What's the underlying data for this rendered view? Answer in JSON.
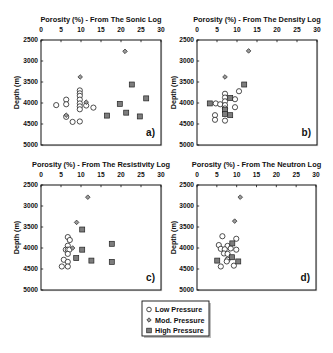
{
  "legend": {
    "items": [
      {
        "label": "Low Pressure",
        "marker": "circle"
      },
      {
        "label": "Mod. Pressure",
        "marker": "diamond"
      },
      {
        "label": "High Pressure",
        "marker": "square"
      }
    ]
  },
  "colors": {
    "axis": "#111111",
    "marker_edge": "#222222",
    "mod_fill": "#9a9a9a",
    "high_fill": "#7d7d7d",
    "low_fill": "#ffffff"
  },
  "chart_data": [
    {
      "type": "scatter",
      "panel_label": "a)",
      "title": "Porosity (%) - From The Sonic Log",
      "xlabel": "Porosity (%) - From The Sonic Log",
      "ylabel": "Depth (m)",
      "xlim": [
        0,
        30
      ],
      "ylim": [
        2500,
        5000
      ],
      "y_inverted": true,
      "x_axis_position": "top",
      "xticks": [
        0,
        5,
        10,
        15,
        20,
        25,
        30
      ],
      "yticks": [
        2500,
        3000,
        3500,
        4000,
        4500,
        5000
      ],
      "grid": false,
      "series": [
        {
          "name": "Low Pressure",
          "marker": "circle",
          "points": [
            [
              3.8,
              4050
            ],
            [
              6.3,
              3920
            ],
            [
              6.3,
              4030
            ],
            [
              6.3,
              4330
            ],
            [
              7.9,
              4450
            ],
            [
              9.7,
              4440
            ],
            [
              9.7,
              3700
            ],
            [
              9.7,
              3770
            ],
            [
              9.7,
              3830
            ],
            [
              9.7,
              3920
            ],
            [
              9.7,
              4010
            ],
            [
              9.7,
              4080
            ],
            [
              9.7,
              4150
            ],
            [
              11.3,
              4060
            ],
            [
              13.1,
              4110
            ]
          ]
        },
        {
          "name": "Mod. Pressure",
          "marker": "diamond",
          "points": [
            [
              21.0,
              2770
            ],
            [
              9.8,
              3380
            ],
            [
              11.3,
              3980
            ],
            [
              6.3,
              4290
            ]
          ]
        },
        {
          "name": "High Pressure",
          "marker": "square",
          "points": [
            [
              22.7,
              3560
            ],
            [
              26.3,
              3890
            ],
            [
              19.7,
              4020
            ],
            [
              16.5,
              4300
            ],
            [
              21.3,
              4230
            ],
            [
              24.7,
              4320
            ]
          ]
        }
      ]
    },
    {
      "type": "scatter",
      "panel_label": "b)",
      "title": "Porosity (%) - From The Density Log",
      "xlabel": "Porosity (%) - From The Density Log",
      "ylabel": "Depth (m)",
      "xlim": [
        0,
        30
      ],
      "ylim": [
        2500,
        5000
      ],
      "y_inverted": true,
      "x_axis_position": "top",
      "xticks": [
        0,
        5,
        10,
        15,
        20,
        25,
        30
      ],
      "yticks": [
        2500,
        3000,
        3500,
        4000,
        4500,
        5000
      ],
      "grid": false,
      "series": [
        {
          "name": "Low Pressure",
          "marker": "circle",
          "points": [
            [
              10.5,
              3720
            ],
            [
              7.0,
              3780
            ],
            [
              7.0,
              3870
            ],
            [
              9.5,
              3910
            ],
            [
              7.0,
              3960
            ],
            [
              4.7,
              4010
            ],
            [
              5.8,
              4030
            ],
            [
              7.0,
              4050
            ],
            [
              9.5,
              4100
            ],
            [
              7.0,
              4130
            ],
            [
              4.5,
              4290
            ],
            [
              4.5,
              4400
            ],
            [
              7.0,
              4420
            ]
          ]
        },
        {
          "name": "Mod. Pressure",
          "marker": "diamond",
          "points": [
            [
              12.9,
              2760
            ],
            [
              7.0,
              3380
            ]
          ]
        },
        {
          "name": "High Pressure",
          "marker": "square",
          "points": [
            [
              11.8,
              3560
            ],
            [
              8.3,
              3880
            ],
            [
              3.2,
              4010
            ],
            [
              7.0,
              4170
            ],
            [
              7.0,
              4260
            ],
            [
              8.3,
              4290
            ]
          ]
        }
      ]
    },
    {
      "type": "scatter",
      "panel_label": "c)",
      "title": "Porosity (%) - From The Resistivity Log",
      "xlabel": "Porosity (%) - From The Resistivity Log",
      "ylabel": "Depth (m)",
      "xlim": [
        0,
        30
      ],
      "ylim": [
        2500,
        5000
      ],
      "y_inverted": true,
      "x_axis_position": "top",
      "xticks": [
        0,
        5,
        10,
        15,
        20,
        25,
        30
      ],
      "yticks": [
        2500,
        3000,
        3500,
        4000,
        4500,
        5000
      ],
      "grid": false,
      "series": [
        {
          "name": "Low Pressure",
          "marker": "circle",
          "points": [
            [
              6.7,
              3740
            ],
            [
              7.2,
              3810
            ],
            [
              6.7,
              3945
            ],
            [
              6.2,
              4040
            ],
            [
              6.7,
              4040
            ],
            [
              7.1,
              4040
            ],
            [
              6.7,
              4140
            ],
            [
              5.7,
              4280
            ],
            [
              6.7,
              4330
            ],
            [
              5.2,
              4440
            ],
            [
              6.7,
              4440
            ]
          ]
        },
        {
          "name": "Mod. Pressure",
          "marker": "diamond",
          "points": [
            [
              11.7,
              2790
            ],
            [
              8.9,
              3390
            ],
            [
              7.9,
              4000
            ]
          ]
        },
        {
          "name": "High Pressure",
          "marker": "square",
          "points": [
            [
              10.3,
              3560
            ],
            [
              17.7,
              3900
            ],
            [
              10.3,
              4040
            ],
            [
              8.8,
              4240
            ],
            [
              12.6,
              4300
            ],
            [
              17.7,
              4330
            ]
          ]
        }
      ]
    },
    {
      "type": "scatter",
      "panel_label": "d)",
      "title": "Porosity (%) - From The Neutron Log",
      "xlabel": "Porosity (%) - From The Neutron Log",
      "ylabel": "Depth (m)",
      "xlim": [
        0,
        30
      ],
      "ylim": [
        2500,
        5000
      ],
      "y_inverted": true,
      "x_axis_position": "top",
      "xticks": [
        0,
        5,
        10,
        15,
        20,
        25,
        30
      ],
      "yticks": [
        2500,
        3000,
        3500,
        4000,
        4500,
        5000
      ],
      "grid": false,
      "series": [
        {
          "name": "Low Pressure",
          "marker": "circle",
          "points": [
            [
              6.4,
              3720
            ],
            [
              9.9,
              3780
            ],
            [
              5.5,
              3930
            ],
            [
              7.7,
              3950
            ],
            [
              6.0,
              4020
            ],
            [
              7.0,
              4030
            ],
            [
              8.5,
              4010
            ],
            [
              9.9,
              4040
            ],
            [
              6.8,
              4130
            ],
            [
              7.7,
              4140
            ],
            [
              7.7,
              4280
            ],
            [
              7.5,
              4320
            ],
            [
              6.0,
              4440
            ],
            [
              9.3,
              4420
            ]
          ]
        },
        {
          "name": "Mod. Pressure",
          "marker": "diamond",
          "points": [
            [
              10.9,
              2790
            ],
            [
              9.5,
              3360
            ]
          ]
        },
        {
          "name": "High Pressure",
          "marker": "square",
          "points": [
            [
              8.9,
              3890
            ],
            [
              5.1,
              4300
            ],
            [
              8.8,
              4220
            ],
            [
              10.4,
              4320
            ]
          ]
        }
      ]
    }
  ]
}
